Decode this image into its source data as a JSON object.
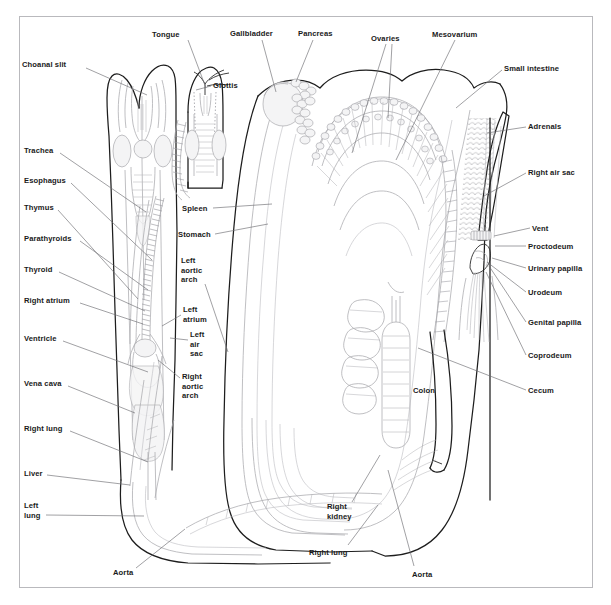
{
  "figure": {
    "type": "anatomical-diagram",
    "frame_color": "#b9b9bd",
    "background_color": "#ffffff",
    "line_color_primary": "#1d1d1d",
    "line_color_secondary": "#a9a9ae",
    "label_color": "#1a1a1a",
    "leader_color": "#6e6e73"
  },
  "labels": [
    {
      "id": "choanal-slit",
      "text": "Choanal slit",
      "x": 22,
      "y": 60,
      "align": "left",
      "leader": [
        [
          86,
          68
        ],
        [
          147,
          95
        ]
      ]
    },
    {
      "id": "tongue",
      "text": "Tongue",
      "x": 152,
      "y": 30,
      "align": "left",
      "leader": [
        [
          188,
          40
        ],
        [
          206,
          88
        ]
      ]
    },
    {
      "id": "glottis",
      "text": "Glottis",
      "x": 213,
      "y": 81,
      "align": "left",
      "leader": [
        [
          211,
          86
        ],
        [
          196,
          90
        ]
      ]
    },
    {
      "id": "gallbladder",
      "text": "Gallbladder",
      "x": 230,
      "y": 29,
      "align": "left",
      "leader": [
        [
          262,
          40
        ],
        [
          276,
          92
        ]
      ]
    },
    {
      "id": "pancreas",
      "text": "Pancreas",
      "x": 298,
      "y": 29,
      "align": "left",
      "leader": [
        [
          313,
          40
        ],
        [
          296,
          82
        ]
      ]
    },
    {
      "id": "ovaries",
      "text": "Ovaries",
      "x": 371,
      "y": 34,
      "align": "left",
      "leader": [
        [
          386,
          44
        ],
        [
          352,
          153
        ]
      ]
    },
    {
      "id": "ovaries-2",
      "text": "",
      "x": 0,
      "y": 0,
      "align": "left",
      "leader": [
        [
          392,
          44
        ],
        [
          388,
          118
        ]
      ]
    },
    {
      "id": "mesovarium",
      "text": "Mesovarium",
      "x": 432,
      "y": 30,
      "align": "left",
      "leader": [
        [
          455,
          40
        ],
        [
          396,
          160
        ]
      ]
    },
    {
      "id": "small-intestine",
      "text": "Small intestine",
      "x": 504,
      "y": 64,
      "align": "left",
      "leader": [
        [
          502,
          70
        ],
        [
          456,
          108
        ]
      ]
    },
    {
      "id": "adrenals",
      "text": "Adrenals",
      "x": 528,
      "y": 122,
      "align": "left",
      "leader": [
        [
          526,
          127
        ],
        [
          487,
          133
        ]
      ]
    },
    {
      "id": "right-air-sac",
      "text": "Right air sac",
      "x": 528,
      "y": 168,
      "align": "left",
      "leader": [
        [
          526,
          173
        ],
        [
          484,
          196
        ]
      ]
    },
    {
      "id": "vent",
      "text": "Vent",
      "x": 532,
      "y": 224,
      "align": "left",
      "leader": [
        [
          530,
          228
        ],
        [
          494,
          236
        ]
      ]
    },
    {
      "id": "proctodeum",
      "text": "Proctodeum",
      "x": 528,
      "y": 242,
      "align": "left",
      "leader": [
        [
          526,
          246
        ],
        [
          495,
          246
        ]
      ]
    },
    {
      "id": "urinary-papilla",
      "text": "Urinary papilla",
      "x": 528,
      "y": 264,
      "align": "left",
      "leader": [
        [
          526,
          268
        ],
        [
          492,
          258
        ]
      ]
    },
    {
      "id": "urodeum",
      "text": "Urodeum",
      "x": 528,
      "y": 288,
      "align": "left",
      "leader": [
        [
          526,
          292
        ],
        [
          487,
          262
        ]
      ]
    },
    {
      "id": "genital-papilla",
      "text": "Genital papilla",
      "x": 528,
      "y": 318,
      "align": "left",
      "leader": [
        [
          526,
          322
        ],
        [
          489,
          266
        ]
      ]
    },
    {
      "id": "coprodeum",
      "text": "Coprodeum",
      "x": 528,
      "y": 351,
      "align": "left",
      "leader": [
        [
          526,
          355
        ],
        [
          486,
          272
        ]
      ]
    },
    {
      "id": "cecum",
      "text": "Cecum",
      "x": 528,
      "y": 386,
      "align": "left",
      "leader": [
        [
          526,
          390
        ],
        [
          418,
          348
        ]
      ]
    },
    {
      "id": "trachea",
      "text": "Trachea",
      "x": 24,
      "y": 146,
      "align": "left",
      "leader": [
        [
          60,
          153
        ],
        [
          146,
          212
        ]
      ]
    },
    {
      "id": "esophagus",
      "text": "Esophagus",
      "x": 24,
      "y": 176,
      "align": "left",
      "leader": [
        [
          71,
          183
        ],
        [
          152,
          260
        ]
      ]
    },
    {
      "id": "thymus",
      "text": "Thymus",
      "x": 24,
      "y": 203,
      "align": "left",
      "leader": [
        [
          58,
          210
        ],
        [
          138,
          299
        ]
      ]
    },
    {
      "id": "parathyroids",
      "text": "Parathyroids",
      "x": 24,
      "y": 234,
      "align": "left",
      "leader": [
        [
          80,
          241
        ],
        [
          148,
          290
        ]
      ]
    },
    {
      "id": "thyroid",
      "text": "Thyroid",
      "x": 24,
      "y": 265,
      "align": "left",
      "leader": [
        [
          59,
          272
        ],
        [
          145,
          311
        ]
      ]
    },
    {
      "id": "right-atrium",
      "text": "Right atrium",
      "x": 24,
      "y": 296,
      "align": "left",
      "leader": [
        [
          80,
          303
        ],
        [
          143,
          324
        ]
      ]
    },
    {
      "id": "ventricle",
      "text": "Ventricle",
      "x": 24,
      "y": 334,
      "align": "left",
      "leader": [
        [
          63,
          341
        ],
        [
          148,
          372
        ]
      ]
    },
    {
      "id": "vena-cava",
      "text": "Vena cava",
      "x": 24,
      "y": 379,
      "align": "left",
      "leader": [
        [
          68,
          386
        ],
        [
          135,
          413
        ]
      ]
    },
    {
      "id": "right-lung",
      "text": "Right lung",
      "x": 24,
      "y": 424,
      "align": "left",
      "leader": [
        [
          70,
          431
        ],
        [
          148,
          462
        ]
      ]
    },
    {
      "id": "liver",
      "text": "Liver",
      "x": 24,
      "y": 469,
      "align": "left",
      "leader": [
        [
          47,
          475
        ],
        [
          130,
          485
        ]
      ]
    },
    {
      "id": "left-lung",
      "text": "Left\nlung",
      "x": 24,
      "y": 501,
      "align": "left",
      "leader": [
        [
          46,
          515
        ],
        [
          144,
          516
        ]
      ]
    },
    {
      "id": "aorta-left",
      "text": "Aorta",
      "x": 113,
      "y": 568,
      "align": "left",
      "leader": [
        [
          136,
          568
        ],
        [
          185,
          529
        ]
      ]
    },
    {
      "id": "spleen",
      "text": "Spleen",
      "x": 182,
      "y": 204,
      "align": "left",
      "leader": [
        [
          213,
          208
        ],
        [
          272,
          204
        ]
      ]
    },
    {
      "id": "stomach",
      "text": "Stomach",
      "x": 178,
      "y": 230,
      "align": "left",
      "leader": [
        [
          215,
          234
        ],
        [
          268,
          224
        ]
      ]
    },
    {
      "id": "left-aortic-arch",
      "text": "Left\naortic\narch",
      "x": 181,
      "y": 256,
      "align": "left",
      "leader": [
        [
          205,
          284
        ],
        [
          228,
          352
        ]
      ]
    },
    {
      "id": "left-atrium",
      "text": "Left\natrium",
      "x": 183,
      "y": 305,
      "align": "left",
      "leader": [
        [
          181,
          315
        ],
        [
          162,
          326
        ]
      ]
    },
    {
      "id": "left-air-sac",
      "text": "Left\nair\nsac",
      "x": 190,
      "y": 330,
      "align": "left",
      "leader": [
        [
          188,
          340
        ],
        [
          170,
          338
        ]
      ]
    },
    {
      "id": "right-aortic-arch",
      "text": "Right\naortic\narch",
      "x": 182,
      "y": 372,
      "align": "left",
      "leader": [
        [
          180,
          378
        ],
        [
          158,
          360
        ]
      ]
    },
    {
      "id": "colon",
      "text": "Colon",
      "x": 413,
      "y": 386,
      "align": "left",
      "leader": []
    },
    {
      "id": "right-kidney",
      "text": "Right\nkidney",
      "x": 327,
      "y": 502,
      "align": "left",
      "leader": [
        [
          352,
          502
        ],
        [
          380,
          455
        ]
      ]
    },
    {
      "id": "right-lung-2",
      "text": "Right lung",
      "x": 309,
      "y": 548,
      "align": "left",
      "leader": [
        [
          348,
          545
        ],
        [
          378,
          505
        ]
      ]
    },
    {
      "id": "aorta-right",
      "text": "Aorta",
      "x": 412,
      "y": 570,
      "align": "left",
      "leader": [
        [
          414,
          566
        ],
        [
          388,
          470
        ]
      ]
    }
  ]
}
